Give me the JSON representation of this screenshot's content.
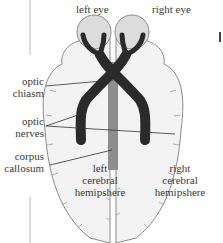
{
  "diagram": {
    "eyes": {
      "left": "left eye",
      "right": "right eye"
    },
    "labels": {
      "optic_chiasm": [
        "optic",
        "chiasm"
      ],
      "optic_nerves": [
        "optic",
        "nerves"
      ],
      "corpus_callosum": [
        "corpus",
        "callosum"
      ],
      "left_hemisphere": [
        "left",
        "cerebral",
        "hemipshere"
      ],
      "right_hemisphere": [
        "right",
        "cerebral",
        "hemipshere"
      ]
    },
    "colors": {
      "brain_fill": "#f2f2f2",
      "brain_outline": "#8a8a8a",
      "eye_fill": "#dcdcdc",
      "optic_pathway": "#2a2a2a",
      "corpus_callosum": "#8e8e8e"
    }
  }
}
